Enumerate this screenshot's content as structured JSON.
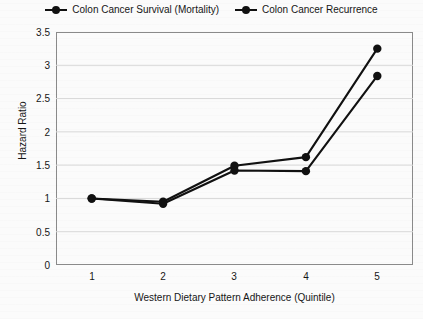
{
  "chart_data": {
    "type": "line",
    "title": "",
    "xlabel": "Western Dietary Pattern Adherence (Quintile)",
    "ylabel": "Hazard Ratio",
    "categories": [
      "1",
      "2",
      "3",
      "4",
      "5"
    ],
    "x": [
      1,
      2,
      3,
      4,
      5
    ],
    "xlim": [
      0.5,
      5.5
    ],
    "ylim": [
      0,
      3.5
    ],
    "yticks": [
      "0",
      "0.5",
      "1",
      "1.5",
      "2",
      "2.5",
      "3",
      "3.5"
    ],
    "ytick_values": [
      0,
      0.5,
      1,
      1.5,
      2,
      2.5,
      3,
      3.5
    ],
    "grid": "horizontal",
    "legend_position": "top-center",
    "series": [
      {
        "name": "Colon Cancer Survival (Mortality)",
        "values": [
          1.0,
          0.95,
          1.49,
          1.62,
          3.25
        ],
        "color": "#111111",
        "marker": "circle"
      },
      {
        "name": "Colon Cancer Recurrence",
        "values": [
          1.0,
          0.92,
          1.42,
          1.41,
          2.84
        ],
        "color": "#111111",
        "marker": "circle"
      }
    ]
  },
  "legend": {
    "items": [
      {
        "label": "Colon Cancer Survival (Mortality)"
      },
      {
        "label": "Colon Cancer Recurrence"
      }
    ]
  },
  "axes": {
    "y_title": "Hazard Ratio",
    "x_title": "Western Dietary Pattern Adherence (Quintile)",
    "y_labels": [
      "3.5",
      "3",
      "2.5",
      "2",
      "1.5",
      "1",
      "0.5",
      "0"
    ],
    "x_labels": [
      "1",
      "2",
      "3",
      "4",
      "5"
    ]
  },
  "colors": {
    "series": "#111111",
    "gridline": "#d8d8d8",
    "axis_border": "#8a8a8a",
    "background": "#fbfbfb",
    "text": "#161616"
  }
}
